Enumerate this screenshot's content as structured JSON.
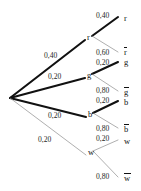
{
  "diagram": {
    "type": "probability-tree",
    "title": "",
    "root": {
      "label": "",
      "x": 10,
      "y": 98
    },
    "branches": [
      {
        "id": "r",
        "node_label": "r",
        "node_x": 87,
        "node_y": 38,
        "first_prob": "0,40",
        "first_prob_x": 44,
        "first_prob_y": 52,
        "emphasis": "thick",
        "children": [
          {
            "id": "r-r",
            "leaf_label": "r",
            "leaf_overline": false,
            "leaf_x": 124,
            "leaf_y": 14,
            "prob": "0,40",
            "prob_x": 96,
            "prob_y": 12,
            "leaf_node_x": 118,
            "leaf_node_y": 17,
            "emphasis": "thick"
          },
          {
            "id": "r-rbar",
            "leaf_label": "r",
            "leaf_overline": true,
            "leaf_x": 124,
            "leaf_y": 48,
            "prob": "0,60",
            "prob_x": 96,
            "prob_y": 49,
            "leaf_node_x": 118,
            "leaf_node_y": 52,
            "emphasis": "thin"
          }
        ]
      },
      {
        "id": "g",
        "node_label": "g",
        "node_x": 87,
        "node_y": 76,
        "first_prob": "0,20",
        "first_prob_x": 48,
        "first_prob_y": 73,
        "emphasis": "thick",
        "children": [
          {
            "id": "g-g",
            "leaf_label": "g",
            "leaf_overline": false,
            "leaf_x": 124,
            "leaf_y": 58,
            "prob": "0,20",
            "prob_x": 96,
            "prob_y": 59,
            "leaf_node_x": 118,
            "leaf_node_y": 62,
            "emphasis": "thick"
          },
          {
            "id": "g-gbar",
            "leaf_label": "g",
            "leaf_overline": true,
            "leaf_x": 124,
            "leaf_y": 88,
            "prob": "0,80",
            "prob_x": 96,
            "prob_y": 87,
            "leaf_node_x": 118,
            "leaf_node_y": 91,
            "emphasis": "thin"
          }
        ]
      },
      {
        "id": "b",
        "node_label": "b",
        "node_x": 88,
        "node_y": 115,
        "first_prob": "0,20",
        "first_prob_x": 48,
        "first_prob_y": 112,
        "emphasis": "thick",
        "children": [
          {
            "id": "b-b",
            "leaf_label": "b",
            "leaf_overline": false,
            "leaf_x": 124,
            "leaf_y": 98,
            "prob": "0,20",
            "prob_x": 96,
            "prob_y": 97,
            "leaf_node_x": 118,
            "leaf_node_y": 101,
            "emphasis": "thick"
          },
          {
            "id": "b-bbar",
            "leaf_label": "b",
            "leaf_overline": true,
            "leaf_x": 124,
            "leaf_y": 125,
            "prob": "0,80",
            "prob_x": 96,
            "prob_y": 125,
            "leaf_node_x": 118,
            "leaf_node_y": 128,
            "emphasis": "thin"
          }
        ]
      },
      {
        "id": "w",
        "node_label": "w",
        "node_x": 88,
        "node_y": 153,
        "first_prob": "0,20",
        "first_prob_x": 38,
        "first_prob_y": 136,
        "emphasis": "thin",
        "children": [
          {
            "id": "w-w",
            "leaf_label": "w",
            "leaf_overline": false,
            "leaf_x": 124,
            "leaf_y": 137,
            "prob": "0,20",
            "prob_x": 96,
            "prob_y": 135,
            "leaf_node_x": 118,
            "leaf_node_y": 140,
            "emphasis": "thin"
          },
          {
            "id": "w-wbar",
            "leaf_label": "w",
            "leaf_overline": true,
            "leaf_x": 124,
            "leaf_y": 174,
            "prob": "0,80",
            "prob_x": 96,
            "prob_y": 173,
            "leaf_node_x": 118,
            "leaf_node_y": 177,
            "emphasis": "thin"
          }
        ]
      }
    ],
    "colors": {
      "thick_stroke": "#111111",
      "thin_stroke": "#8c8c8c",
      "text": "#1a1a1a",
      "background": "#ffffff"
    }
  }
}
